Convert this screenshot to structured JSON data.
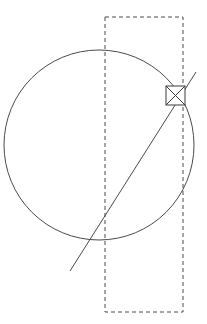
{
  "figure": {
    "canvas": {
      "width": 207,
      "height": 324,
      "background": "#ffffff"
    },
    "stroke_color": "#4a4a4a",
    "marker_stroke_color": "#3a3a3a",
    "caption": ""
  },
  "shapes": {
    "circle": {
      "name": "circle",
      "center_x": 99,
      "center_y": 145,
      "radius": 95,
      "stroke": "solid",
      "label": "circle"
    },
    "dashed_rectangle": {
      "name": "dashed-rectangle",
      "x": 105,
      "y": 17,
      "width": 78,
      "height": 295,
      "stroke": "dashed",
      "label": "bounding rectangle"
    },
    "diagonal_line": {
      "name": "diagonal-line",
      "x1": 70,
      "y1": 271,
      "x2": 196,
      "y2": 72,
      "stroke": "solid",
      "label": "diagonal"
    },
    "marker_box": {
      "name": "marker-box",
      "x": 166,
      "y": 86,
      "width": 19,
      "height": 19,
      "label": "intersection marker",
      "glyph": "x-cross"
    }
  },
  "geometry_notes": {
    "circle_top_y": 50,
    "circle_bottom_y": 240,
    "circle_left_x": 4,
    "circle_right_x": 194,
    "marker_center_x": 175,
    "marker_center_y": 95
  }
}
